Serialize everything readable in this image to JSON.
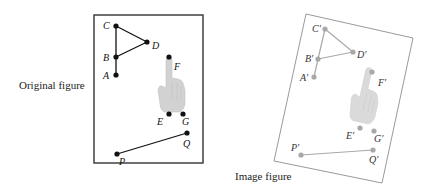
{
  "captions": {
    "original": "Original figure",
    "image": "Image figure"
  },
  "colors": {
    "original_stroke": "#111111",
    "image_stroke": "#a8a8a8",
    "hand_fill": "#d2d2d2",
    "frame_original": "#333333",
    "frame_image": "#9a9a9a"
  },
  "original": {
    "frame": {
      "x": 94,
      "y": 15,
      "w": 109,
      "h": 148
    },
    "points": {
      "A": {
        "label": "A",
        "x": 116,
        "y": 75
      },
      "B": {
        "label": "B",
        "x": 116,
        "y": 57
      },
      "C": {
        "label": "C",
        "x": 116,
        "y": 26
      },
      "D": {
        "label": "D",
        "x": 147,
        "y": 42
      },
      "E": {
        "label": "E",
        "x": 169,
        "y": 114
      },
      "F": {
        "label": "F",
        "x": 169,
        "y": 57
      },
      "G": {
        "label": "G",
        "x": 183,
        "y": 114
      },
      "P": {
        "label": "P",
        "x": 117,
        "y": 154
      },
      "Q": {
        "label": "Q",
        "x": 187,
        "y": 133
      }
    },
    "segments": [
      "A-B",
      "B-C",
      "C-D",
      "D-B",
      "P-Q"
    ]
  },
  "image": {
    "frame_corners": [
      [
        306,
        14
      ],
      [
        413,
        38
      ],
      [
        382,
        183
      ],
      [
        274,
        161
      ]
    ],
    "points": {
      "A": {
        "label": "A′",
        "x": 314,
        "y": 77
      },
      "B": {
        "label": "B′",
        "x": 318,
        "y": 59
      },
      "C": {
        "label": "C′",
        "x": 325,
        "y": 29
      },
      "D": {
        "label": "D′",
        "x": 353,
        "y": 52
      },
      "E": {
        "label": "E′",
        "x": 360,
        "y": 128
      },
      "F": {
        "label": "F′",
        "x": 372,
        "y": 72
      },
      "G": {
        "label": "G′",
        "x": 374,
        "y": 131
      },
      "P": {
        "label": "P′",
        "x": 301,
        "y": 155
      },
      "Q": {
        "label": "Q′",
        "x": 373,
        "y": 150
      }
    },
    "segments": [
      "A-B",
      "B-C",
      "C-D",
      "D-B",
      "P-Q"
    ]
  }
}
